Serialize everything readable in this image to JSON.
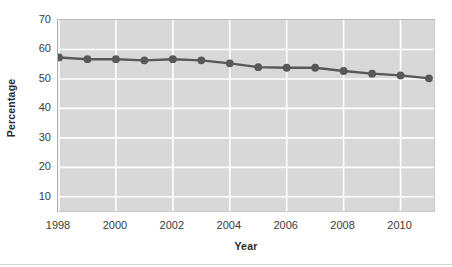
{
  "chart_data": {
    "type": "line",
    "title": "",
    "xlabel": "Year",
    "ylabel": "Percentage",
    "x": [
      1998,
      1999,
      2000,
      2001,
      2002,
      2003,
      2004,
      2005,
      2006,
      2007,
      2008,
      2009,
      2010,
      2011
    ],
    "values": [
      57.3,
      56.7,
      56.7,
      56.3,
      56.7,
      56.3,
      55.3,
      54.0,
      53.8,
      53.8,
      52.7,
      51.8,
      51.2,
      50.2
    ],
    "series": [
      {
        "name": "Percentage",
        "values": [
          57.3,
          56.7,
          56.7,
          56.3,
          56.7,
          56.3,
          55.3,
          54.0,
          53.8,
          53.8,
          52.7,
          51.8,
          51.2,
          50.2
        ]
      }
    ],
    "xlim": [
      1998,
      2011
    ],
    "ylim": [
      0,
      70
    ],
    "ytick_labels": [
      "70",
      "60",
      "50",
      "40",
      "30",
      "20",
      "10"
    ],
    "ytick_values": [
      70,
      60,
      50,
      40,
      30,
      20,
      10
    ],
    "xtick_labels": [
      "1998",
      "2000",
      "2002",
      "2004",
      "2006",
      "2008",
      "2010"
    ],
    "xtick_values": [
      1998,
      2000,
      2002,
      2004,
      2006,
      2008,
      2010
    ],
    "grid": true,
    "grid_color": "#ffffff",
    "plot_background": "#d8d8d8",
    "line_color": "#585858",
    "marker_color": "#585858",
    "marker_shape": "circle",
    "legend": false,
    "legend_position": "none"
  }
}
